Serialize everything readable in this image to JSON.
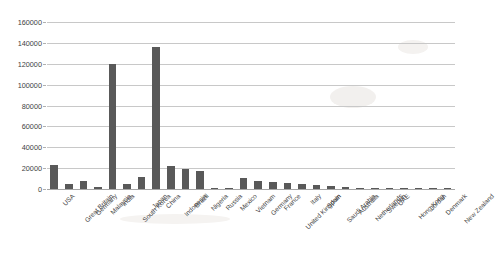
{
  "chart_data": {
    "type": "bar",
    "title": "",
    "subtitle": "",
    "xlabel": "",
    "ylabel": "",
    "ylim": [
      0,
      160000
    ],
    "y_tick_step": 20000,
    "grid": true,
    "legend": "none",
    "bar_color": "#595959",
    "gridline_color": "#c8c8c8",
    "y_ticks": [
      "160000",
      "140000",
      "120000",
      "100000",
      "80000",
      "60000",
      "40000",
      "20000",
      "0"
    ],
    "categories": [
      "USA",
      "Great Britain",
      "Germany",
      "Malaysia",
      "India",
      "South Korea",
      "Japan",
      "China",
      "Indonesia",
      "Brazil",
      "Nigeria",
      "Russia",
      "Mexico",
      "Vietnam",
      "Germany",
      "France",
      "United Kingdom",
      "Italy",
      "Spain",
      "Saudi Arabia",
      "Australia",
      "Netherlands",
      "Sweden",
      "UAE",
      "Hong Kong",
      "Jordan",
      "Denmark",
      "New Zealand"
    ],
    "values": [
      23000,
      4500,
      7500,
      2000,
      120000,
      4500,
      11500,
      136000,
      22500,
      19000,
      17000,
      700,
      1000,
      11000,
      8000,
      7000,
      5500,
      4500,
      4200,
      3000,
      1600,
      1200,
      800,
      500,
      400,
      300,
      250,
      200
    ]
  }
}
